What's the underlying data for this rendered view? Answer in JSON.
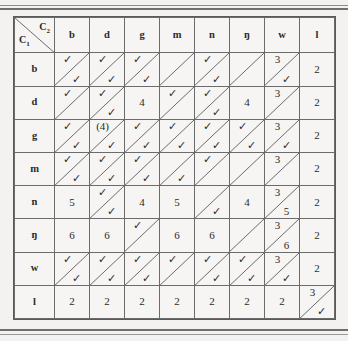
{
  "table": {
    "corner": {
      "col_var": "C",
      "col_sub": "2",
      "row_var": "C",
      "row_sub": "1"
    },
    "columns": [
      "b",
      "d",
      "g",
      "m",
      "n",
      "ŋ",
      "w",
      "l"
    ],
    "rows": [
      "b",
      "d",
      "g",
      "m",
      "n",
      "ŋ",
      "w",
      "l"
    ],
    "check_glyph": "✓",
    "cells": [
      [
        {
          "split": true,
          "upper": "✓",
          "lower": "✓"
        },
        {
          "split": true,
          "upper": "✓",
          "lower": "✓"
        },
        {
          "split": true,
          "upper": "✓",
          "lower": "✓"
        },
        {
          "split": true,
          "upper": "",
          "lower": ""
        },
        {
          "split": true,
          "upper": "✓",
          "lower": "✓"
        },
        {
          "split": true,
          "upper": "",
          "lower": ""
        },
        {
          "split": true,
          "upper": "3",
          "lower": "✓"
        },
        {
          "split": false,
          "value": "2"
        }
      ],
      [
        {
          "split": true,
          "upper": "✓",
          "lower": ""
        },
        {
          "split": true,
          "upper": "✓",
          "lower": "✓"
        },
        {
          "split": false,
          "value": "4"
        },
        {
          "split": true,
          "upper": "✓",
          "lower": ""
        },
        {
          "split": true,
          "upper": "✓",
          "lower": "✓"
        },
        {
          "split": false,
          "value": "4"
        },
        {
          "split": true,
          "upper": "3",
          "lower": ""
        },
        {
          "split": false,
          "value": "2"
        }
      ],
      [
        {
          "split": true,
          "upper": "✓",
          "lower": "✓"
        },
        {
          "split": true,
          "upper": "(4)",
          "lower": "✓"
        },
        {
          "split": true,
          "upper": "✓",
          "lower": "✓"
        },
        {
          "split": true,
          "upper": "✓",
          "lower": "✓"
        },
        {
          "split": true,
          "upper": "✓",
          "lower": "✓"
        },
        {
          "split": true,
          "upper": "✓",
          "lower": "✓"
        },
        {
          "split": true,
          "upper": "3",
          "lower": "✓"
        },
        {
          "split": false,
          "value": "2"
        }
      ],
      [
        {
          "split": true,
          "upper": "✓",
          "lower": "✓"
        },
        {
          "split": true,
          "upper": "✓",
          "lower": "✓"
        },
        {
          "split": true,
          "upper": "✓",
          "lower": "✓"
        },
        {
          "split": true,
          "upper": "",
          "lower": "✓"
        },
        {
          "split": true,
          "upper": "✓",
          "lower": ""
        },
        {
          "split": true,
          "upper": "",
          "lower": ""
        },
        {
          "split": true,
          "upper": "3",
          "lower": ""
        },
        {
          "split": false,
          "value": "2"
        }
      ],
      [
        {
          "split": false,
          "value": "5"
        },
        {
          "split": true,
          "upper": "✓",
          "lower": "✓"
        },
        {
          "split": false,
          "value": "4"
        },
        {
          "split": false,
          "value": "5"
        },
        {
          "split": true,
          "upper": "",
          "lower": "✓"
        },
        {
          "split": false,
          "value": "4"
        },
        {
          "split": true,
          "upper": "3",
          "lower": "5"
        },
        {
          "split": false,
          "value": "2"
        }
      ],
      [
        {
          "split": false,
          "value": "6"
        },
        {
          "split": false,
          "value": "6"
        },
        {
          "split": true,
          "upper": "✓",
          "lower": ""
        },
        {
          "split": false,
          "value": "6"
        },
        {
          "split": false,
          "value": "6"
        },
        {
          "split": true,
          "upper": "",
          "lower": ""
        },
        {
          "split": true,
          "upper": "3",
          "lower": "6"
        },
        {
          "split": false,
          "value": "2"
        }
      ],
      [
        {
          "split": true,
          "upper": "✓",
          "lower": "✓"
        },
        {
          "split": true,
          "upper": "✓",
          "lower": "✓"
        },
        {
          "split": true,
          "upper": "✓",
          "lower": "✓"
        },
        {
          "split": true,
          "upper": "✓",
          "lower": ""
        },
        {
          "split": true,
          "upper": "✓",
          "lower": "✓"
        },
        {
          "split": true,
          "upper": "✓",
          "lower": "✓"
        },
        {
          "split": true,
          "upper": "3",
          "lower": "✓"
        },
        {
          "split": false,
          "value": "2"
        }
      ],
      [
        {
          "split": false,
          "value": "2"
        },
        {
          "split": false,
          "value": "2"
        },
        {
          "split": false,
          "value": "2"
        },
        {
          "split": false,
          "value": "2"
        },
        {
          "split": false,
          "value": "2"
        },
        {
          "split": false,
          "value": "2"
        },
        {
          "split": false,
          "value": "2"
        },
        {
          "split": true,
          "upper": "3",
          "lower": "✓"
        }
      ]
    ]
  },
  "colors": {
    "ink": "#2b2b2b",
    "rule": "#6b6b6b",
    "paper": "#f6f5f3",
    "page": "#f2f1ef"
  }
}
